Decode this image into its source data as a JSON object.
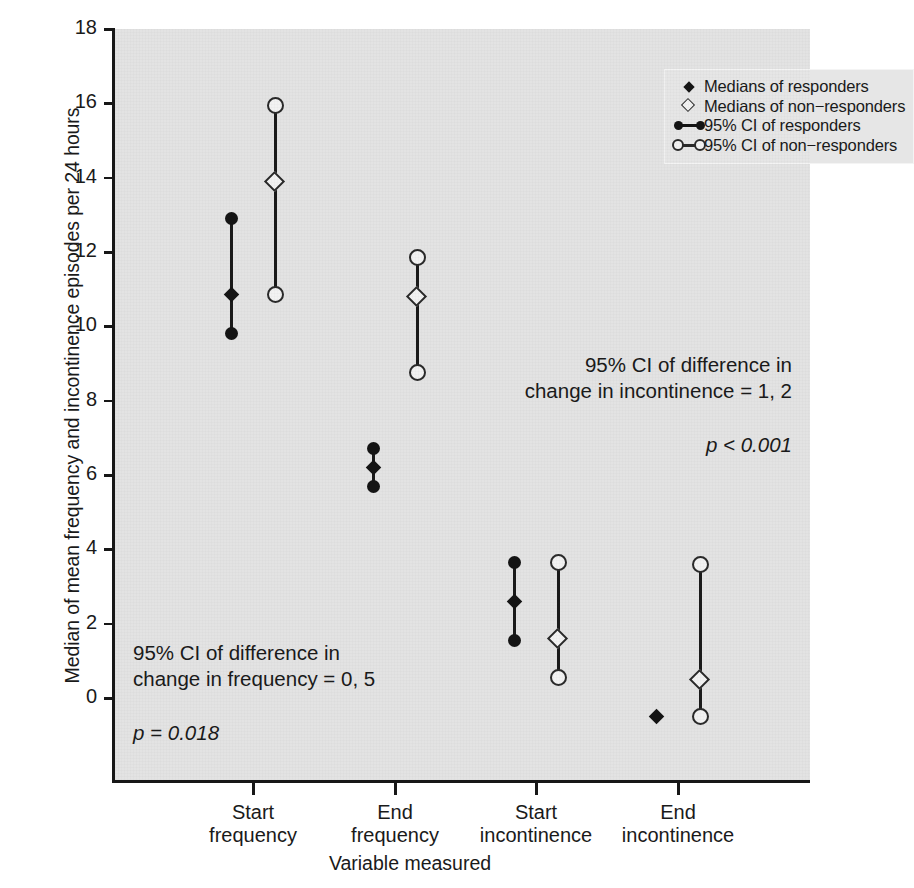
{
  "chart_data": {
    "type": "scatter",
    "title": "",
    "xlabel": "Variable measured",
    "ylabel": "Median of mean frequency and incontinence episodes per 24 hours",
    "categories": [
      "Start frequency",
      "End frequency",
      "Start incontinence",
      "End incontinence"
    ],
    "category_labels": [
      {
        "line1": "Start",
        "line2": "frequency"
      },
      {
        "line1": "End",
        "line2": "frequency"
      },
      {
        "line1": "Start",
        "line2": "incontinence"
      },
      {
        "line1": "End",
        "line2": "incontinence"
      }
    ],
    "ylim": [
      -1.3,
      18
    ],
    "yticks": [
      0,
      2,
      4,
      6,
      8,
      10,
      12,
      14,
      16,
      18
    ],
    "grid": false,
    "legend_position": "top-right",
    "series": [
      {
        "name": "responders",
        "marker": "filled-diamond",
        "ci_marker": "filled-circle",
        "points": [
          {
            "category": "Start frequency",
            "median": 10.85,
            "ci_low": 9.8,
            "ci_high": 12.9
          },
          {
            "category": "End frequency",
            "median": 6.2,
            "ci_low": 5.7,
            "ci_high": 6.7
          },
          {
            "category": "Start incontinence",
            "median": 2.6,
            "ci_low": 1.55,
            "ci_high": 3.65
          },
          {
            "category": "End incontinence",
            "median": -0.5,
            "ci_low": -0.5,
            "ci_high": -0.5
          }
        ]
      },
      {
        "name": "non-responders",
        "marker": "open-diamond",
        "ci_marker": "open-circle",
        "points": [
          {
            "category": "Start frequency",
            "median": 13.9,
            "ci_low": 10.85,
            "ci_high": 15.95
          },
          {
            "category": "End frequency",
            "median": 10.8,
            "ci_low": 8.75,
            "ci_high": 11.85
          },
          {
            "category": "Start incontinence",
            "median": 1.6,
            "ci_low": 0.55,
            "ci_high": 3.65
          },
          {
            "category": "End incontinence",
            "median": 0.5,
            "ci_low": -0.5,
            "ci_high": 3.6
          }
        ]
      }
    ],
    "annotations": [
      {
        "id": "incontinence",
        "text": "95% CI of difference in\nchange in incontinence = 1, 2",
        "pvalue": "p < 0.001"
      },
      {
        "id": "frequency",
        "text": "95% CI of difference in\nchange in frequency = 0, 5",
        "pvalue": "p = 0.018"
      }
    ]
  },
  "legend": {
    "items": [
      {
        "label": "Medians of responders",
        "key": "filled-diamond"
      },
      {
        "label": "Medians of non−responders",
        "key": "open-diamond"
      },
      {
        "label": "95% CI of responders",
        "key": "filled-circle-bar"
      },
      {
        "label": "95% CI of non−responders",
        "key": "open-circle-bar"
      }
    ]
  },
  "colors": {
    "plot_background": "#e3e3e3",
    "axis": "#171717",
    "responder": "#141414",
    "non_responder_fill": "#f2f2f2",
    "non_responder_stroke": "#2a2a2a",
    "page_background": "#ffffff"
  }
}
